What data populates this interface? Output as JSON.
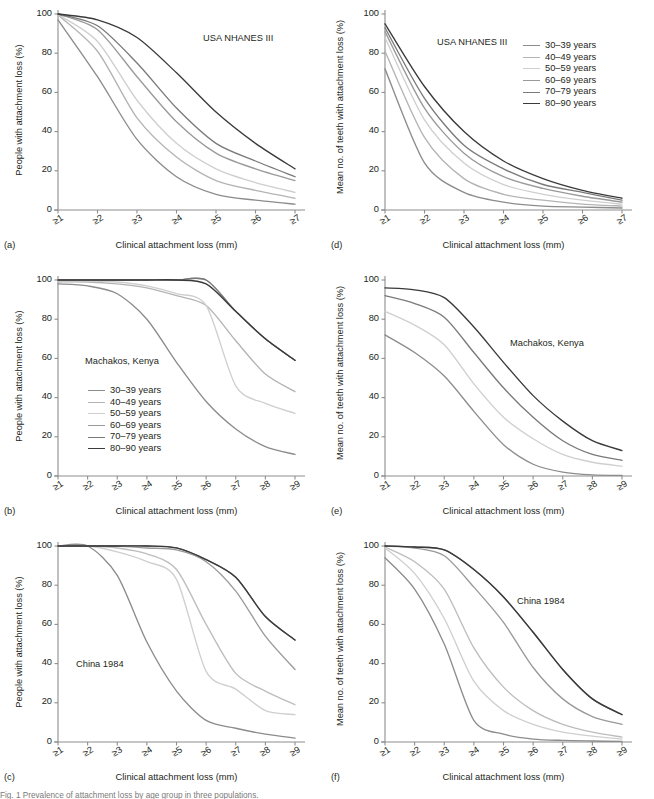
{
  "figure": {
    "xlabel": "Clinical attachment loss (mm)",
    "ylabel_people": "People with attachment loss (%)",
    "ylabel_teeth": "Mean no. of teeth  with attachment loss (%)",
    "panel_tags": {
      "a": "(a)",
      "b": "(b)",
      "c": "(c)",
      "d": "(d)",
      "e": "(e)",
      "f": "(f)"
    },
    "yticks": [
      "0",
      "20",
      "40",
      "60",
      "80",
      "100"
    ],
    "xticks_7": [
      "≥1",
      "≥2",
      "≥3",
      "≥4",
      "≥5",
      "≥6",
      "≥7"
    ],
    "xticks_9": [
      "≥1",
      "≥2",
      "≥3",
      "≥4",
      "≥5",
      "≥6",
      "≥7",
      "≥8",
      "≥9"
    ],
    "study_usa": "USA NHANES III",
    "study_kenya": "Machakos, Kenya",
    "study_china": "China 1984",
    "legend_title": "",
    "legend": [
      {
        "label": "30–39 years",
        "color": "#8c8c8c"
      },
      {
        "label": "40–49 years",
        "color": "#b4b4b4"
      },
      {
        "label": "50–59 years",
        "color": "#cfcfcf"
      },
      {
        "label": "60–69 years",
        "color": "#9a9a9a"
      },
      {
        "label": "70–79 years",
        "color": "#7a7a7a"
      },
      {
        "label": "80–90 years",
        "color": "#3a3a3a"
      }
    ],
    "axis_color": "#8d8d8d",
    "text_color": "#231f20",
    "caption": "Fig. 1  Prevalence of attachment loss by age group in three populations."
  },
  "chart_data": [
    {
      "id": "a",
      "type": "line",
      "title": "USA NHANES III",
      "xlabel": "Clinical attachment loss (mm)",
      "ylabel": "People with attachment loss (%)",
      "categories": [
        "≥1",
        "≥2",
        "≥3",
        "≥4",
        "≥5",
        "≥6",
        "≥7"
      ],
      "ylim": [
        0,
        100
      ],
      "grid": false,
      "legend_position": "none",
      "series": [
        {
          "name": "30–39 years",
          "color": "#8c8c8c",
          "values": [
            97,
            68,
            36,
            17,
            8,
            5,
            3
          ]
        },
        {
          "name": "40–49 years",
          "color": "#b4b4b4",
          "values": [
            99.5,
            81,
            47,
            27,
            15,
            10,
            6
          ]
        },
        {
          "name": "50–59 years",
          "color": "#cfcfcf",
          "values": [
            99.7,
            86,
            56,
            34,
            21,
            14,
            9
          ]
        },
        {
          "name": "60–69 years",
          "color": "#9a9a9a",
          "values": [
            100,
            92,
            68,
            45,
            29,
            21,
            15
          ]
        },
        {
          "name": "70–79 years",
          "color": "#7a7a7a",
          "values": [
            100,
            94,
            75,
            52,
            34,
            25,
            17
          ]
        },
        {
          "name": "80–90 years",
          "color": "#3a3a3a",
          "values": [
            100,
            97,
            88,
            70,
            50,
            34,
            21
          ]
        }
      ]
    },
    {
      "id": "d",
      "type": "line",
      "title": "USA NHANES III",
      "xlabel": "Clinical attachment loss (mm)",
      "ylabel": "Mean no. of teeth  with attachment loss (%)",
      "categories": [
        "≥1",
        "≥2",
        "≥3",
        "≥4",
        "≥5",
        "≥6",
        "≥7"
      ],
      "ylim": [
        0,
        100
      ],
      "grid": false,
      "legend_position": "upper-right",
      "series": [
        {
          "name": "30–39 years",
          "color": "#8c8c8c",
          "values": [
            72,
            24,
            9,
            4,
            2,
            1.5,
            1
          ]
        },
        {
          "name": "40–49 years",
          "color": "#b4b4b4",
          "values": [
            81,
            37,
            16,
            8,
            5,
            3,
            2
          ]
        },
        {
          "name": "50–59 years",
          "color": "#cfcfcf",
          "values": [
            88,
            46,
            24,
            13,
            8,
            5,
            3
          ]
        },
        {
          "name": "60–69 years",
          "color": "#9a9a9a",
          "values": [
            91,
            52,
            29,
            17,
            11,
            7,
            4
          ]
        },
        {
          "name": "70–79 years",
          "color": "#7a7a7a",
          "values": [
            93,
            57,
            33,
            21,
            13,
            9,
            5
          ]
        },
        {
          "name": "80–90 years",
          "color": "#3a3a3a",
          "values": [
            95,
            63,
            40,
            25,
            16,
            10,
            6
          ]
        }
      ]
    },
    {
      "id": "b",
      "type": "line",
      "title": "Machakos, Kenya",
      "xlabel": "Clinical attachment loss (mm)",
      "ylabel": "People with attachment loss (%)",
      "categories": [
        "≥1",
        "≥2",
        "≥3",
        "≥4",
        "≥5",
        "≥6",
        "≥7",
        "≥8",
        "≥9"
      ],
      "ylim": [
        0,
        100
      ],
      "grid": false,
      "legend_position": "left-middle",
      "series": [
        {
          "name": "30–39 years",
          "color": "#8c8c8c",
          "values": [
            98,
            97,
            93,
            80,
            58,
            38,
            24,
            15,
            11
          ]
        },
        {
          "name": "40–49 years",
          "color": "#b4b4b4",
          "values": [
            99,
            99,
            98,
            96,
            92,
            87,
            69,
            52,
            43
          ]
        },
        {
          "name": "50–59 years",
          "color": "#cfcfcf",
          "values": [
            99.5,
            99.5,
            99,
            97,
            93,
            87,
            46,
            37,
            32
          ]
        },
        {
          "name": "60–69 years",
          "color": "#9a9a9a",
          "values": [
            100,
            100,
            100,
            100,
            100,
            100,
            84,
            70,
            59
          ]
        },
        {
          "name": "70–79 years",
          "color": "#7a7a7a",
          "values": [
            100,
            100,
            100,
            100,
            100,
            100,
            84,
            70,
            59
          ]
        },
        {
          "name": "80–90 years",
          "color": "#3a3a3a",
          "values": [
            100,
            100,
            100,
            100,
            100,
            98,
            84,
            70,
            59
          ]
        }
      ]
    },
    {
      "id": "e",
      "type": "line",
      "title": "Machakos, Kenya",
      "xlabel": "Clinical attachment loss (mm)",
      "ylabel": "Mean no. of teeth  with attachment loss (%)",
      "categories": [
        "≥1",
        "≥2",
        "≥3",
        "≥4",
        "≥5",
        "≥6",
        "≥7",
        "≥8",
        "≥9"
      ],
      "ylim": [
        0,
        100
      ],
      "grid": false,
      "legend_position": "none",
      "series": [
        {
          "name": "30–39 years",
          "color": "#8c8c8c",
          "values": [
            72,
            63,
            51,
            33,
            16,
            6,
            2,
            0.6,
            0.3
          ]
        },
        {
          "name": "50–59 years",
          "color": "#cfcfcf",
          "values": [
            84,
            77,
            67,
            47,
            30,
            19,
            11,
            7,
            5
          ]
        },
        {
          "name": "70–79 years",
          "color": "#7a7a7a",
          "values": [
            92,
            88,
            81,
            63,
            45,
            30,
            18,
            11,
            8
          ]
        },
        {
          "name": "80–90 years",
          "color": "#3a3a3a",
          "values": [
            96,
            95,
            91,
            76,
            58,
            41,
            28,
            18,
            13
          ]
        }
      ]
    },
    {
      "id": "c",
      "type": "line",
      "title": "China 1984",
      "xlabel": "Clinical attachment loss (mm)",
      "ylabel": "People with attachment loss (%)",
      "categories": [
        "≥1",
        "≥2",
        "≥3",
        "≥4",
        "≥5",
        "≥6",
        "≥7",
        "≥8",
        "≥9"
      ],
      "ylim": [
        0,
        100
      ],
      "grid": false,
      "legend_position": "none",
      "series": [
        {
          "name": "30–39 years",
          "color": "#8c8c8c",
          "values": [
            100,
            100,
            85,
            51,
            26,
            11,
            7,
            4,
            2
          ]
        },
        {
          "name": "40–49 years",
          "color": "#cfcfcf",
          "values": [
            100,
            100,
            97,
            92,
            83,
            36,
            27,
            16,
            14
          ]
        },
        {
          "name": "50–59 years",
          "color": "#bdbdbd",
          "values": [
            100,
            100,
            99,
            96,
            88,
            60,
            35,
            26,
            19
          ]
        },
        {
          "name": "60–69 years",
          "color": "#9a9a9a",
          "values": [
            100,
            100,
            100,
            99,
            98,
            92,
            77,
            54,
            37
          ]
        },
        {
          "name": "70–79 years",
          "color": "#7a7a7a",
          "values": [
            100,
            100,
            100,
            100,
            99,
            93,
            84,
            64,
            52
          ]
        },
        {
          "name": "80–90 years",
          "color": "#3a3a3a",
          "values": [
            100,
            100,
            100,
            100,
            99,
            93,
            84,
            64,
            52
          ]
        }
      ]
    },
    {
      "id": "f",
      "type": "line",
      "title": "China 1984",
      "xlabel": "Clinical attachment loss (mm)",
      "ylabel": "Mean no. of teeth  with attachment loss (%)",
      "categories": [
        "≥1",
        "≥2",
        "≥3",
        "≥4",
        "≥5",
        "≥6",
        "≥7",
        "≥8",
        "≥9"
      ],
      "ylim": [
        0,
        100
      ],
      "grid": false,
      "legend_position": "none",
      "series": [
        {
          "name": "30–39 years",
          "color": "#8c8c8c",
          "values": [
            94,
            78,
            50,
            11,
            4,
            1.5,
            0.8,
            0.5,
            0.3
          ]
        },
        {
          "name": "40–49 years",
          "color": "#cfcfcf",
          "values": [
            99,
            86,
            63,
            31,
            16,
            9,
            5,
            3,
            1.5
          ]
        },
        {
          "name": "50–59 years",
          "color": "#bdbdbd",
          "values": [
            99.5,
            92,
            78,
            48,
            28,
            16,
            9,
            5,
            2.5
          ]
        },
        {
          "name": "60–69 years",
          "color": "#9a9a9a",
          "values": [
            100,
            99,
            95,
            79,
            61,
            38,
            22,
            13,
            9
          ]
        },
        {
          "name": "70–79 years",
          "color": "#7a7a7a",
          "values": [
            100,
            99.5,
            98,
            88,
            74,
            56,
            37,
            22,
            14
          ]
        },
        {
          "name": "80–90 years",
          "color": "#3a3a3a",
          "values": [
            100,
            99.5,
            98,
            88,
            74,
            56,
            37,
            22,
            14
          ]
        }
      ]
    }
  ]
}
